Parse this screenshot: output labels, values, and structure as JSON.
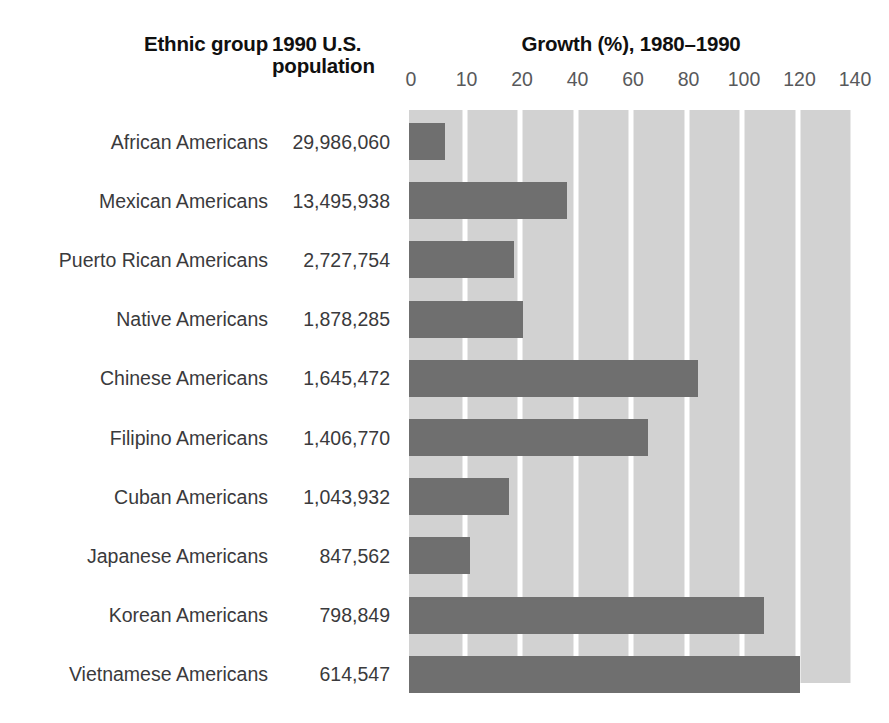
{
  "header": {
    "col_group": "Ethnic group",
    "col_population": "1990 U.S.\npopulation",
    "col_population_line1": "1990 U.S.",
    "col_population_line2": "population",
    "chart_title": "Growth (%), 1980–1990"
  },
  "colors": {
    "bar": "#6f6f6f",
    "plot_background": "#d2d2d2",
    "gridline": "#ffffff",
    "page_background": "#ffffff",
    "header_text": "#101010",
    "body_text": "#3a3a3c",
    "tick_text": "#58595b"
  },
  "chart_data": {
    "type": "bar",
    "orientation": "horizontal",
    "title": "Growth (%), 1980–1990",
    "xlabel": "Growth (%), 1980–1990",
    "ylabel": "Ethnic group",
    "xlim": [
      0,
      160
    ],
    "grid": true,
    "legend": "none",
    "tick_labels": [
      "0",
      "10",
      "20",
      "40",
      "60",
      "80",
      "100",
      "120",
      "140"
    ],
    "tick_values": [
      0,
      20,
      40,
      60,
      80,
      100,
      120,
      140,
      160
    ],
    "categories": [
      "African Americans",
      "Mexican Americans",
      "Puerto Rican Americans",
      "Native Americans",
      "Chinese Americans",
      "Filipino Americans",
      "Cuban Americans",
      "Japanese Americans",
      "Korean Americans",
      "Vietnamese Americans"
    ],
    "values": [
      13,
      57,
      38,
      41,
      104,
      86,
      36,
      22,
      128,
      141
    ],
    "series": [
      {
        "name": "Growth (%), 1980–1990",
        "values": [
          13,
          57,
          38,
          41,
          104,
          86,
          36,
          22,
          128,
          141
        ]
      }
    ]
  },
  "rows": [
    {
      "group": "African Americans",
      "population": "29,986,060",
      "growth": 13
    },
    {
      "group": "Mexican Americans",
      "population": "13,495,938",
      "growth": 57
    },
    {
      "group": "Puerto Rican Americans",
      "population": "2,727,754",
      "growth": 38
    },
    {
      "group": "Native Americans",
      "population": "1,878,285",
      "growth": 41
    },
    {
      "group": "Chinese Americans",
      "population": "1,645,472",
      "growth": 104
    },
    {
      "group": "Filipino Americans",
      "population": "1,406,770",
      "growth": 86
    },
    {
      "group": "Cuban Americans",
      "population": "1,043,932",
      "growth": 36
    },
    {
      "group": "Japanese Americans",
      "population": "847,562",
      "growth": 22
    },
    {
      "group": "Korean Americans",
      "population": "798,849",
      "growth": 128
    },
    {
      "group": "Vietnamese Americans",
      "population": "614,547",
      "growth": 141
    }
  ]
}
